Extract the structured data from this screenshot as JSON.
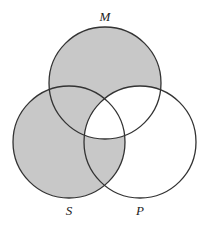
{
  "diagram": {
    "type": "venn",
    "sets": [
      {
        "id": "M",
        "label": "M",
        "cx": 105,
        "cy": 83,
        "r": 56
      },
      {
        "id": "S",
        "label": "S",
        "cx": 69,
        "cy": 142,
        "r": 56
      },
      {
        "id": "P",
        "label": "P",
        "cx": 140,
        "cy": 142,
        "r": 56
      }
    ],
    "shaded_regions": [
      "M only",
      "S only",
      "M∩S only",
      "S∩P only"
    ],
    "unshaded_regions": [
      "P only",
      "M∩P only",
      "M∩S∩P"
    ],
    "colors": {
      "shade": "#c8c8c8",
      "stroke": "#333333",
      "background": "#ffffff"
    }
  },
  "labels": {
    "M": "M",
    "S": "S",
    "P": "P"
  }
}
